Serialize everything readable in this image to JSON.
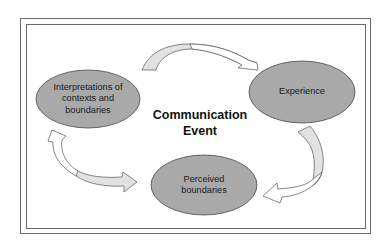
{
  "diagram": {
    "title": "Communication\nEvent",
    "nodes": [
      {
        "id": "interpretations",
        "label": "Interpretations of\ncontexts and\nboundaries"
      },
      {
        "id": "experience",
        "label": "Experience"
      },
      {
        "id": "perceived",
        "label": "Perceived\nboundaries"
      }
    ],
    "edges": [
      {
        "from": "interpretations",
        "to": "experience"
      },
      {
        "from": "experience",
        "to": "perceived"
      },
      {
        "from": "perceived",
        "to": "interpretations"
      }
    ],
    "colors": {
      "node_fill": "#a9a9a9",
      "node_stroke": "#4a4a4a",
      "arrow_fill_light": "#e2e2e2",
      "arrow_fill_white": "#ffffff",
      "arrow_stroke": "#555555",
      "frame": "#6a6a6a"
    }
  }
}
